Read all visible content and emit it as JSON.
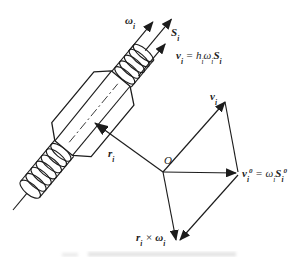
{
  "figure": {
    "background": "#ffffff",
    "ink": "#1c1c1c",
    "description_labels_only": "screw joint kinematics diagram"
  },
  "labels": {
    "angular_velocity": {
      "base": "ω",
      "sub": "i"
    },
    "screw_axis": {
      "base": "S",
      "sub": "i"
    },
    "pitch_velocity": {
      "v": "v",
      "v_sub": "i",
      "eq": " = ",
      "h": "h",
      "h_sub": "i",
      "omega": "ω",
      "omega_sub": "i",
      "s": "S",
      "s_sub": "i"
    },
    "position_vector": {
      "base": "r",
      "sub": "i"
    },
    "origin": "O",
    "velocity": {
      "base": "v",
      "sub": "i"
    },
    "moment": {
      "v": "v",
      "v_sub": "i",
      "v_sup": "0",
      "eq": " = ",
      "omega": "ω",
      "omega_sub": "i",
      "s": "S",
      "s_sub": "i",
      "s_sup": "0"
    },
    "cross_product": {
      "r": "r",
      "r_sub": "i",
      "times": " × ",
      "omega": "ω",
      "omega_sub": "i"
    }
  }
}
